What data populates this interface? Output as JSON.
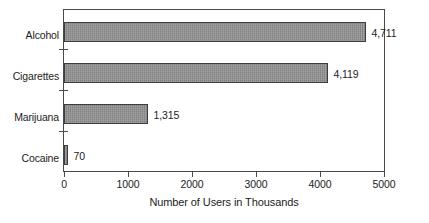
{
  "chart_data": {
    "type": "bar",
    "orientation": "horizontal",
    "title": "",
    "subtitle": "",
    "xlabel": "Number of Users in Thousands",
    "ylabel": "",
    "categories": [
      "Alcohol",
      "Cigarettes",
      "Marijuana",
      "Cocaine"
    ],
    "values": [
      4711,
      4119,
      1315,
      70
    ],
    "value_labels": [
      "4,711",
      "4,119",
      "1,315",
      "70"
    ],
    "xlim": [
      0,
      5000
    ],
    "xticks": [
      0,
      1000,
      2000,
      3000,
      4000,
      5000
    ],
    "xtick_labels": [
      "0",
      "1000",
      "2000",
      "3000",
      "4000",
      "5000"
    ],
    "grid": false,
    "legend": false,
    "legend_position": "none",
    "bar_color": "#8e8e8e",
    "bar_border_color": "#3d3d3d",
    "axis_color": "#4a4a4a",
    "text_color": "#1c1c1c",
    "background_color": "#ffffff"
  },
  "axis": {
    "x_title": "Number of Users in Thousands"
  }
}
